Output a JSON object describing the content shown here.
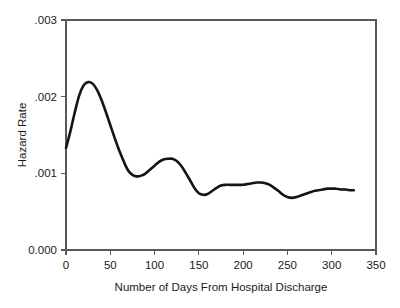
{
  "chart_data": {
    "type": "line",
    "title": "",
    "xlabel": "Number of Days From Hospital Discharge",
    "ylabel": "Hazard Rate",
    "xlim": [
      0,
      350
    ],
    "ylim": [
      0,
      0.003
    ],
    "grid": false,
    "legend": "none",
    "frame": "box",
    "x_ticks": [
      0,
      50,
      100,
      150,
      200,
      250,
      300,
      350
    ],
    "x_tick_labels": [
      "0",
      "50",
      "100",
      "150",
      "200",
      "250",
      "300",
      "350"
    ],
    "y_ticks": [
      0,
      0.001,
      0.002,
      0.003
    ],
    "y_tick_labels": [
      "0.000",
      ".001",
      ".002",
      ".003"
    ],
    "series": [
      {
        "name": "Hazard Rate",
        "color": "#141414",
        "x": [
          0,
          5,
          10,
          15,
          20,
          25,
          30,
          35,
          40,
          45,
          50,
          55,
          60,
          65,
          70,
          75,
          80,
          85,
          90,
          95,
          100,
          105,
          110,
          115,
          120,
          125,
          130,
          135,
          140,
          145,
          150,
          155,
          160,
          165,
          170,
          175,
          180,
          185,
          190,
          195,
          200,
          205,
          210,
          215,
          220,
          225,
          230,
          235,
          240,
          245,
          250,
          255,
          260,
          265,
          270,
          275,
          280,
          285,
          290,
          295,
          300,
          305,
          310,
          315,
          320,
          325
        ],
        "y": [
          0.00133,
          0.00155,
          0.0018,
          0.00202,
          0.00215,
          0.00219,
          0.00217,
          0.00209,
          0.00196,
          0.0018,
          0.00163,
          0.00146,
          0.0013,
          0.00116,
          0.00104,
          0.00098,
          0.00096,
          0.00097,
          0.001,
          0.00105,
          0.0011,
          0.00115,
          0.00118,
          0.00119,
          0.00119,
          0.00116,
          0.0011,
          0.00101,
          0.00091,
          0.00081,
          0.00074,
          0.00072,
          0.00073,
          0.00077,
          0.00081,
          0.00084,
          0.00085,
          0.00085,
          0.00085,
          0.00085,
          0.00085,
          0.00086,
          0.00087,
          0.00088,
          0.00088,
          0.00087,
          0.00085,
          0.00081,
          0.00077,
          0.00072,
          0.00069,
          0.00068,
          0.00069,
          0.00071,
          0.00073,
          0.00075,
          0.00077,
          0.00078,
          0.00079,
          0.0008,
          0.0008,
          0.0008,
          0.00079,
          0.00079,
          0.00078,
          0.00078
        ]
      }
    ]
  }
}
